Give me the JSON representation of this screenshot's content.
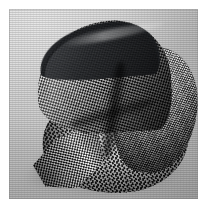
{
  "image": {
    "title": "Folded houndstooth fabric",
    "subject": "necktie-folded-textile",
    "medium": "black-and-white photograph",
    "caption": "A length of fine houndstooth-check fabric folded and curled into a spiral shell shape, photographed on a plain light-grey studio backdrop.",
    "orientation": "portrait",
    "width_px": "207",
    "height_px": "211"
  },
  "plate": {
    "name": "photographic-plate",
    "left_px": "9",
    "top_px": "9",
    "width_px": "189",
    "height_px": "190",
    "margin_color": "#ffffff"
  },
  "palette": {
    "page_margin": "#ffffff",
    "backdrop_light": "#e0e0e0",
    "backdrop_mid": "#c9c9c9",
    "backdrop_dark": "#bdbdbd",
    "weave_light": "#f2f2f2",
    "weave_dark": "#141414",
    "fabric_shadow": "#0e0f11",
    "cast_shadow": "rgba(40,40,40,0.50)"
  },
  "regions": [
    {
      "id": "fold-upper",
      "label": "upper sweeping curl",
      "description": "Large fabric sheet arcing from lower-centre up to the upper-left, shading from mid-grey at the left edge to near black toward the crease."
    },
    {
      "id": "fold-lip",
      "label": "dark leading edge lip",
      "description": "Thin very dark selvedge running along the top-left boundary of the curl."
    },
    {
      "id": "bulge-right",
      "label": "right-hand rounded bulge",
      "description": "Lighter front-facing panel on the right, catching the key light, fine even check visible."
    },
    {
      "id": "panel-front",
      "label": "lower frontal panel",
      "description": "Broad dark lower sheet of fabric spreading toward the bottom-right with a rounded hem."
    },
    {
      "id": "tip-left",
      "label": "pointed lower-left tip",
      "description": "Sharp folded corner of the fabric projecting to the lower left."
    },
    {
      "id": "crease",
      "label": "central spiral crease",
      "description": "Deep vertical shadow where the curl tucks behind the front panel."
    },
    {
      "id": "cast-shadow",
      "label": "cast shadow",
      "description": "Soft grey shadow pooled beneath and to the left of the object on the backdrop."
    },
    {
      "id": "rim-light",
      "label": "specular rim highlight",
      "description": "Bright thin highlight along the crest of the upper curl."
    }
  ],
  "pattern": {
    "name": "houndstooth-check",
    "scale": "very fine",
    "colors": [
      "#f2f2f2",
      "#141414"
    ]
  }
}
